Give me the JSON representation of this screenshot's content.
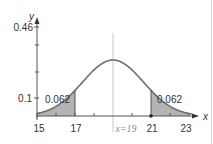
{
  "chart_data": {
    "type": "area",
    "title": "",
    "xlabel": "x",
    "ylabel": "y",
    "xlim": [
      15,
      23.4
    ],
    "ylim": [
      0,
      0.46
    ],
    "x_ticks": [
      "15",
      "17",
      "21",
      "23"
    ],
    "x_minor_ticks": [
      16,
      18,
      20,
      22
    ],
    "y_ticks": [
      "0.1",
      "0.46"
    ],
    "distribution": "normal",
    "mean": 19,
    "mean_label": "x=19",
    "shaded_regions": [
      {
        "from": 15,
        "to": 17,
        "area": 0.062,
        "label": "0.062"
      },
      {
        "from": 21,
        "to": 23,
        "area": 0.062,
        "label": "0.062"
      }
    ],
    "grid": false,
    "legend": "none"
  },
  "axes": {
    "x_label": "x",
    "y_label": "y",
    "y_top_label": "0.46",
    "y_mid_label": "0.1",
    "x_tick_labels": {
      "t15": "15",
      "t17": "17",
      "t21": "21",
      "t23": "23"
    },
    "mean_label": "x=19"
  },
  "annotations": {
    "left_area": "0.062",
    "right_area": "0.062"
  },
  "colors": {
    "shade": "#b4b4b4",
    "curve": "#6e6e6e",
    "axis": "#555555",
    "mean_line": "#c8c8c8"
  }
}
